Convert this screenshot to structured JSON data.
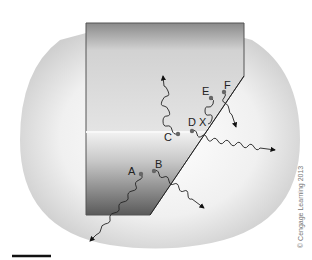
{
  "figure": {
    "kind": "diagram",
    "points": [
      {
        "label": "A",
        "x": 141,
        "y": 174
      },
      {
        "label": "B",
        "x": 154,
        "y": 171
      },
      {
        "label": "C",
        "x": 178,
        "y": 134
      },
      {
        "label": "D",
        "x": 192,
        "y": 131
      },
      {
        "label": "E",
        "x": 211,
        "y": 98
      },
      {
        "label": "F",
        "x": 224,
        "y": 92
      }
    ],
    "intersection_label": "X",
    "copyright": "© Cengage Learning 2013",
    "colors": {
      "background_blob": "#e6e6e6",
      "block_light": "#dcdcdc",
      "block_dark": "#555555",
      "line": "#222222",
      "point": "#666666"
    }
  }
}
